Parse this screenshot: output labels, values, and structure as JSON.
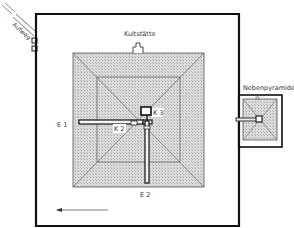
{
  "diagram": {
    "type": "pyramid-site-plan",
    "labels": {
      "aufweg": "Aufweg",
      "kultstaette": "Kultstätte",
      "nebenpyramide": "Nebenpyramide",
      "e1": "E 1",
      "e2": "E 2",
      "k1": "K 1",
      "k2": "K 2",
      "k3": "K 3"
    },
    "colors": {
      "wall": "#111111",
      "pyramid_fill": "#d4d4d4",
      "edge": "#555555",
      "corridor": "#333333",
      "background": "#ffffff"
    },
    "north_arrow_direction": "left"
  }
}
